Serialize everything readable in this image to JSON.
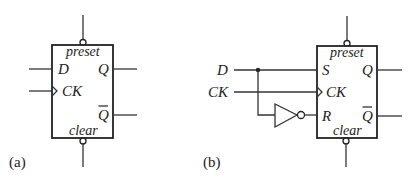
{
  "diagram": {
    "panel_a": {
      "caption": "(a)",
      "block": {
        "top_label": "preset",
        "bottom_label": "clear",
        "inputs": [
          "D",
          "CK"
        ],
        "outputs": [
          "Q",
          "Q"
        ],
        "output_bar": [
          false,
          true
        ]
      }
    },
    "panel_b": {
      "caption": "(b)",
      "external_inputs": [
        "D",
        "CK"
      ],
      "block": {
        "top_label": "preset",
        "bottom_label": "clear",
        "inputs": [
          "S",
          "CK",
          "R"
        ],
        "outputs": [
          "Q",
          "Q"
        ],
        "output_bar": [
          false,
          true
        ]
      },
      "components": [
        "inverter"
      ]
    },
    "colors": {
      "line": "#222222",
      "background": "#ffffff"
    }
  }
}
